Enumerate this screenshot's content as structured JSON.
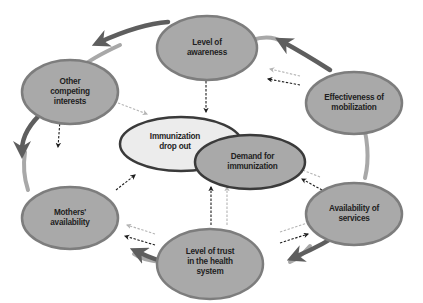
{
  "diagram": {
    "type": "cycle",
    "colors": {
      "outer_node_fill": "#a9a9a9",
      "outer_node_stroke": "#7d7d7d",
      "dropout_fill": "#ececec",
      "dropout_stroke": "#3a3a3a",
      "demand_fill": "#a9a9a9",
      "demand_stroke": "#3a3a3a",
      "ring_light": "#a8a8a8",
      "ring_dark": "#5e5e5e",
      "dashed_dark": "#1e1e1e",
      "dashed_light": "#b4b4b4"
    },
    "outer_nodes": [
      {
        "id": "awareness",
        "label": "Level of\nawareness"
      },
      {
        "id": "mobilization",
        "label": "Effectiveness of\nmobilization"
      },
      {
        "id": "services",
        "label": "Availability of\nservices"
      },
      {
        "id": "trust",
        "label": "Level of trust\nin the health\nsystem"
      },
      {
        "id": "mothers",
        "label": "Mothers'\navailability"
      },
      {
        "id": "competing",
        "label": "Other\ncompeting\ninterests"
      }
    ],
    "center_nodes": [
      {
        "id": "dropout",
        "label": "Immunization\ndrop out"
      },
      {
        "id": "demand",
        "label": "Demand for\nimmunization"
      }
    ],
    "ring_direction": "counter-clockwise",
    "influence_arrows": {
      "dark_dashed_to": "dropout",
      "light_dashed_to": "demand"
    }
  }
}
